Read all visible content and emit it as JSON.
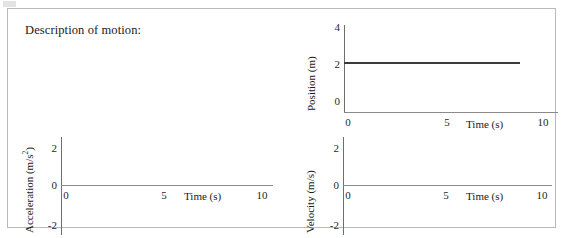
{
  "worksheet": {
    "prompt_label": "Description of motion:"
  },
  "chart_data": [
    {
      "id": "position",
      "type": "line",
      "title": "",
      "xlabel": "Time (s)",
      "ylabel": "Position (m)",
      "xlim": [
        0,
        10
      ],
      "ylim": [
        0,
        4
      ],
      "xticks": [
        "0",
        "5",
        "10"
      ],
      "yticks": [
        "4",
        "2",
        "0"
      ],
      "grid": false,
      "legend": "none",
      "series": [
        {
          "name": "position",
          "x": [
            0,
            8.5
          ],
          "values": [
            2,
            2
          ],
          "color": "#3a3a3a"
        }
      ]
    },
    {
      "id": "acceleration",
      "type": "line",
      "title": "",
      "xlabel": "Time (s)",
      "ylabel_prefix": "Acceleration (m/s",
      "ylabel_sup": "2",
      "ylabel_suffix": ")",
      "ylabel": "Acceleration (m/s2)",
      "xlim": [
        0,
        10
      ],
      "ylim": [
        -2,
        2
      ],
      "xticks": [
        "0",
        "5",
        "10"
      ],
      "yticks": [
        "2",
        "0",
        "-2"
      ],
      "grid": false,
      "legend": "none",
      "series": []
    },
    {
      "id": "velocity",
      "type": "line",
      "title": "",
      "xlabel": "Time (s)",
      "ylabel": "Velocity (m/s)",
      "xlim": [
        0,
        10
      ],
      "ylim": [
        -2,
        2
      ],
      "xticks": [
        "0",
        "5",
        "10"
      ],
      "yticks": [
        "2",
        "0",
        "-2"
      ],
      "grid": false,
      "legend": "none",
      "series": []
    }
  ]
}
